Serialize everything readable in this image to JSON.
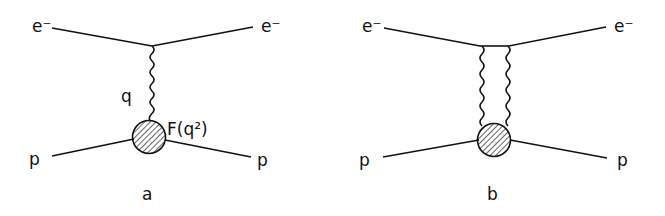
{
  "figure": {
    "diagrams": [
      {
        "id": "a",
        "caption": "a",
        "labels": {
          "electron_in": "e⁻",
          "electron_out": "e⁻",
          "proton_in": "p",
          "proton_out": "p",
          "photon": "q",
          "form_factor": "F(q²)"
        },
        "description": "One-photon exchange in electron-proton scattering with proton form factor"
      },
      {
        "id": "b",
        "caption": "b",
        "labels": {
          "electron_in": "e⁻",
          "electron_out": "e⁻",
          "proton_in": "p",
          "proton_out": "p"
        },
        "description": "Two-photon exchange in electron-proton scattering"
      }
    ]
  }
}
